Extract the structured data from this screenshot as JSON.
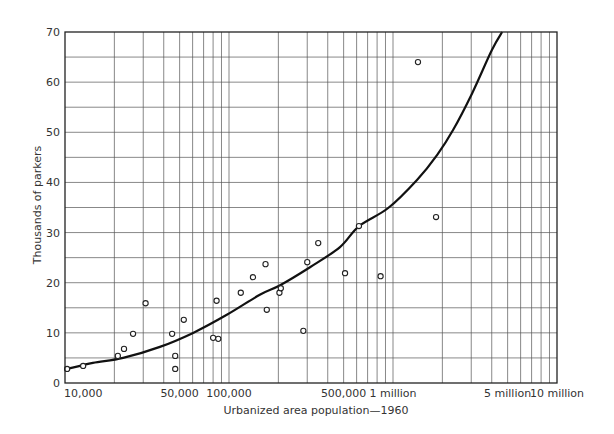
{
  "chart_data": {
    "type": "scatter",
    "title": "",
    "xlabel": "Urbanized area population—1960",
    "ylabel": "Thousands of parkers",
    "xscale": "log",
    "xlim": [
      10000,
      10000000
    ],
    "ylim": [
      0,
      70
    ],
    "grid": true,
    "legend": null,
    "x_ticks": [
      {
        "value": 10000,
        "label": "10,000"
      },
      {
        "value": 50000,
        "label": "50,000"
      },
      {
        "value": 100000,
        "label": "100,000"
      },
      {
        "value": 500000,
        "label": "500,000"
      },
      {
        "value": 1000000,
        "label": "1 million"
      },
      {
        "value": 5000000,
        "label": "5 million"
      },
      {
        "value": 10000000,
        "label": "10 million"
      }
    ],
    "y_ticks": [
      0,
      10,
      20,
      30,
      40,
      50,
      60,
      70
    ],
    "y_minor_grid_step": 5,
    "series": [
      {
        "name": "Observed urban areas",
        "kind": "scatter",
        "marker": "open-circle",
        "points": [
          {
            "x": 10300,
            "y": 2.8
          },
          {
            "x": 12900,
            "y": 3.4
          },
          {
            "x": 21000,
            "y": 5.4
          },
          {
            "x": 22900,
            "y": 6.8
          },
          {
            "x": 26000,
            "y": 9.8
          },
          {
            "x": 31000,
            "y": 15.9
          },
          {
            "x": 45000,
            "y": 9.8
          },
          {
            "x": 47000,
            "y": 5.4
          },
          {
            "x": 47000,
            "y": 2.8
          },
          {
            "x": 53000,
            "y": 12.6
          },
          {
            "x": 80000,
            "y": 9.0
          },
          {
            "x": 86000,
            "y": 8.8
          },
          {
            "x": 84000,
            "y": 16.4
          },
          {
            "x": 118000,
            "y": 18.0
          },
          {
            "x": 140000,
            "y": 21.1
          },
          {
            "x": 167000,
            "y": 23.7
          },
          {
            "x": 170000,
            "y": 14.6
          },
          {
            "x": 203000,
            "y": 18.0
          },
          {
            "x": 207000,
            "y": 18.9
          },
          {
            "x": 284000,
            "y": 10.4
          },
          {
            "x": 300000,
            "y": 24.1
          },
          {
            "x": 350000,
            "y": 27.9
          },
          {
            "x": 510000,
            "y": 21.9
          },
          {
            "x": 620000,
            "y": 31.3
          },
          {
            "x": 840000,
            "y": 21.3
          },
          {
            "x": 1420000,
            "y": 64.0
          },
          {
            "x": 1830000,
            "y": 33.1
          }
        ]
      },
      {
        "name": "Fitted curve",
        "kind": "line",
        "points": [
          {
            "x": 10300,
            "y": 2.8
          },
          {
            "x": 14800,
            "y": 4.0
          },
          {
            "x": 22600,
            "y": 5.0
          },
          {
            "x": 37900,
            "y": 7.2
          },
          {
            "x": 60400,
            "y": 10.0
          },
          {
            "x": 97000,
            "y": 13.6
          },
          {
            "x": 154000,
            "y": 17.6
          },
          {
            "x": 205000,
            "y": 19.5
          },
          {
            "x": 312000,
            "y": 23.1
          },
          {
            "x": 475000,
            "y": 27.1
          },
          {
            "x": 621000,
            "y": 31.3
          },
          {
            "x": 935000,
            "y": 34.9
          },
          {
            "x": 1400000,
            "y": 40.5
          },
          {
            "x": 1860000,
            "y": 45.5
          },
          {
            "x": 2330000,
            "y": 50.5
          },
          {
            "x": 3040000,
            "y": 57.8
          },
          {
            "x": 4010000,
            "y": 66.4
          },
          {
            "x": 4630000,
            "y": 70.0
          }
        ]
      }
    ]
  },
  "colors": {
    "ink": "#222222",
    "grid": "#555555",
    "background": "#ffffff"
  }
}
